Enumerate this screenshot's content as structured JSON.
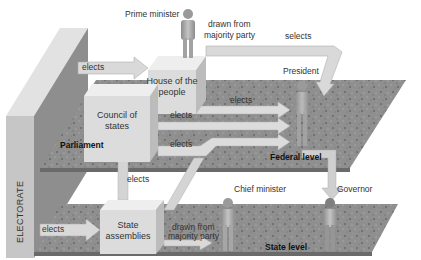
{
  "diagram": {
    "title": "",
    "colors": {
      "platform": "#8e8e8e",
      "platform_speckle": "#4a4a4a",
      "block_front": "#dcdcdc",
      "block_top": "#efefef",
      "block_side": "#bdbdbd",
      "arrow": "#d8d8d8",
      "arrow_edge": "#b4b4b4",
      "wall_front": "#c4c4c4",
      "wall_side": "#9a9a9a",
      "wall_top": "#e2e2e2",
      "figure": "#a9a9a9"
    },
    "wall": {
      "label": "ELECTORATE"
    },
    "levels": {
      "federal": {
        "label": "Federal level"
      },
      "parliament": {
        "label": "Parliament"
      },
      "state": {
        "label": "State level"
      }
    },
    "nodes": {
      "house_of_people": {
        "label_line1": "House of the",
        "label_line2": "people"
      },
      "council_of_states": {
        "label_line1": "Council of",
        "label_line2": "states"
      },
      "state_assemblies": {
        "label_line1": "State",
        "label_line2": "assemblies"
      },
      "prime_minister": {
        "label": "Prime minister"
      },
      "president": {
        "label": "President"
      },
      "chief_minister": {
        "label": "Chief minister"
      },
      "governor": {
        "label": "Governor"
      }
    },
    "edges": [
      {
        "from": "Electorate",
        "to": "House of the people",
        "label": "elects"
      },
      {
        "from": "House of the people",
        "to": "President",
        "label": "elects"
      },
      {
        "from": "Council of states",
        "to": "President",
        "label": "elects"
      },
      {
        "from": "State assemblies",
        "to": "President",
        "label": "elects"
      },
      {
        "from": "State assemblies",
        "to": "Council of states",
        "label": "elects"
      },
      {
        "from": "Electorate",
        "to": "State assemblies",
        "label": "elects"
      },
      {
        "from": "House of the people",
        "to": "Prime minister",
        "label_line1": "drawn from",
        "label_line2": "majority party"
      },
      {
        "from": "State assemblies",
        "to": "Chief minister",
        "label_line1": "drawn from",
        "label_line2": "majority party"
      },
      {
        "from": "President",
        "to": "Prime minister",
        "label": "selects"
      },
      {
        "from": "President",
        "to": "Governor",
        "label": ""
      }
    ]
  }
}
